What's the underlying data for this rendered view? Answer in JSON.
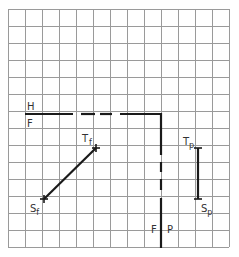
{
  "diagram": {
    "type": "descriptive-geometry-projection",
    "grid": {
      "origin_x": 8,
      "origin_y": 9,
      "cell": 17,
      "cols": 13,
      "rows": 14,
      "line_color": "#9a9a9a",
      "border_color": "#888888"
    },
    "fold_lines": {
      "hf": {
        "label_above": "H",
        "label_below": "F"
      },
      "fp": {
        "label_left": "F",
        "label_right": "P"
      }
    },
    "points": {
      "tf": {
        "label": "T",
        "subscript": "f"
      },
      "sf": {
        "label": "S",
        "subscript": "f"
      },
      "tp": {
        "label": "T",
        "subscript": "p"
      },
      "sp": {
        "label": "S",
        "subscript": "p"
      }
    },
    "colors": {
      "line": "#1a1a1a",
      "text": "#333333"
    }
  }
}
